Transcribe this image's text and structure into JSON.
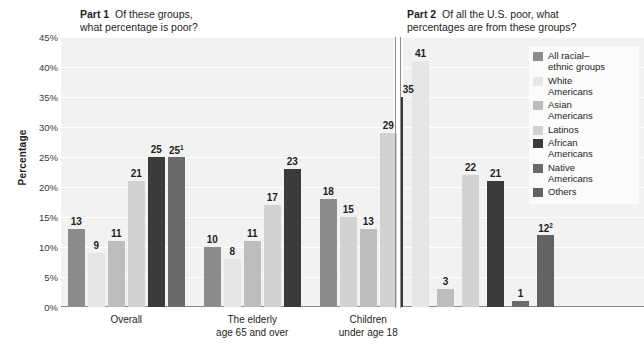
{
  "part1": {
    "title_strong": "Part 1",
    "title_rest": "Of these groups,",
    "title_line2": "what percentage is poor?"
  },
  "part2": {
    "title_strong": "Part 2",
    "title_rest": "Of all the U.S. poor, what",
    "title_line2": "percentages are from these groups?"
  },
  "axis": {
    "ylabel": "Percentage",
    "yticks": [
      "45%",
      "40%",
      "35%",
      "30%",
      "25%",
      "20%",
      "15%",
      "10%",
      "5%",
      "0%"
    ]
  },
  "legend": {
    "items": [
      {
        "label_line1": "All racial–",
        "label_line2": "ethnic groups",
        "color": "#8c8c8c"
      },
      {
        "label_line1": "White",
        "label_line2": "Americans",
        "color": "#e6e6e6"
      },
      {
        "label_line1": "Asian",
        "label_line2": "Americans",
        "color": "#bdbdbd"
      },
      {
        "label_line1": "Latinos",
        "label_line2": "",
        "color": "#d2d2d2"
      },
      {
        "label_line1": "African",
        "label_line2": "Americans",
        "color": "#3b3b3b"
      },
      {
        "label_line1": "Native",
        "label_line2": "Americans",
        "color": "#6b6b6b"
      },
      {
        "label_line1": "Others",
        "label_line2": "",
        "color": "#636363"
      }
    ]
  },
  "chart_data": {
    "type": "bar",
    "xlabel": "",
    "ylabel": "Percentage",
    "ylim": [
      0,
      45
    ],
    "ytick_values": [
      0,
      5,
      10,
      15,
      20,
      25,
      30,
      35,
      40,
      45
    ],
    "grid": true,
    "legend_position": "right",
    "series": [
      {
        "name": "All racial–ethnic groups",
        "color": "#8c8c8c"
      },
      {
        "name": "White Americans",
        "color": "#e6e6e6"
      },
      {
        "name": "Asian Americans",
        "color": "#bdbdbd"
      },
      {
        "name": "Latinos",
        "color": "#d2d2d2"
      },
      {
        "name": "African Americans",
        "color": "#3b3b3b"
      },
      {
        "name": "Native Americans",
        "color": "#6b6b6b"
      },
      {
        "name": "Others",
        "color": "#636363"
      }
    ],
    "panels": [
      {
        "panel": "Part 1",
        "question": "Of these groups, what percentage is poor?",
        "groups": [
          {
            "category": "Overall",
            "label_line1": "Overall",
            "label_line2": "",
            "bars": [
              {
                "series": "All racial–ethnic groups",
                "value": 13,
                "label": "13",
                "color": "#8c8c8c"
              },
              {
                "series": "White Americans",
                "value": 9,
                "label": "9",
                "color": "#e6e6e6"
              },
              {
                "series": "Asian Americans",
                "value": 11,
                "label": "11",
                "color": "#bdbdbd"
              },
              {
                "series": "Latinos",
                "value": 21,
                "label": "21",
                "color": "#d2d2d2"
              },
              {
                "series": "African Americans",
                "value": 25,
                "label": "25",
                "color": "#3b3b3b"
              },
              {
                "series": "Native Americans",
                "value": 25,
                "label": "25",
                "footnote": "1",
                "color": "#6b6b6b"
              }
            ]
          },
          {
            "category": "The elderly age 65 and over",
            "label_line1": "The elderly",
            "label_line2": "age 65 and over",
            "bars": [
              {
                "series": "All racial–ethnic groups",
                "value": 10,
                "label": "10",
                "color": "#8c8c8c"
              },
              {
                "series": "White Americans",
                "value": 8,
                "label": "8",
                "color": "#e6e6e6"
              },
              {
                "series": "Asian Americans",
                "value": 11,
                "label": "11",
                "color": "#bdbdbd"
              },
              {
                "series": "Latinos",
                "value": 17,
                "label": "17",
                "color": "#d2d2d2"
              },
              {
                "series": "African Americans",
                "value": 23,
                "label": "23",
                "color": "#3b3b3b"
              }
            ]
          },
          {
            "category": "Children under age 18",
            "label_line1": "Children",
            "label_line2": "under age 18",
            "bars": [
              {
                "series": "All racial–ethnic groups",
                "value": 18,
                "label": "18",
                "color": "#8c8c8c"
              },
              {
                "series": "White Americans",
                "value": 15,
                "label": "15",
                "color": "#d2d2d2"
              },
              {
                "series": "Asian Americans",
                "value": 13,
                "label": "13",
                "color": "#bdbdbd"
              },
              {
                "series": "Latinos",
                "value": 29,
                "label": "29",
                "color": "#d2d2d2"
              },
              {
                "series": "African Americans",
                "value": 35,
                "label": "35",
                "color": "#3b3b3b"
              }
            ]
          }
        ]
      },
      {
        "panel": "Part 2",
        "question": "Of all the U.S. poor, what percentages are from these groups?",
        "groups": [
          {
            "category": "",
            "label_line1": "",
            "label_line2": "",
            "bars": [
              {
                "series": "White Americans",
                "value": 41,
                "label": "41",
                "color": "#e6e6e6"
              },
              {
                "series": "Asian Americans",
                "value": 3,
                "label": "3",
                "color": "#bdbdbd"
              },
              {
                "series": "Latinos",
                "value": 22,
                "label": "22",
                "color": "#d2d2d2"
              },
              {
                "series": "African Americans",
                "value": 21,
                "label": "21",
                "color": "#3b3b3b"
              },
              {
                "series": "Native Americans",
                "value": 1,
                "label": "1",
                "color": "#6b6b6b"
              },
              {
                "series": "Others",
                "value": 12,
                "label": "12",
                "footnote": "2",
                "color": "#636363"
              }
            ]
          }
        ]
      }
    ]
  }
}
